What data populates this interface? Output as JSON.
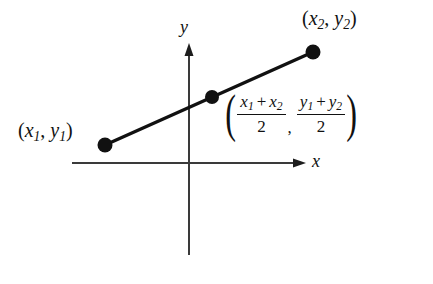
{
  "figure": {
    "background_color": "#ffffff",
    "ink_color": "#111111",
    "axis_color": "#3a3a3a"
  },
  "axes": {
    "x_label": "x",
    "y_label": "y",
    "origin": {
      "x": 189,
      "y": 163
    },
    "x_axis": {
      "start_x": 72,
      "end_x": 305,
      "y": 163
    },
    "y_axis": {
      "x": 189,
      "top_y": 45,
      "bottom_y": 255
    }
  },
  "segment": {
    "stroke_width": 3,
    "color": "#111111",
    "endpoints": [
      {
        "name": "point-1",
        "x": 105,
        "y": 145
      },
      {
        "name": "point-2",
        "x": 313,
        "y": 52
      }
    ],
    "midpoint": {
      "name": "midpoint",
      "x": 212,
      "y": 97
    },
    "dot_radius": 7
  },
  "labels": {
    "point1": {
      "open": "(",
      "var_x": "x",
      "sub_x": "1",
      "comma": ", ",
      "var_y": "y",
      "sub_y": "1",
      "close": ")"
    },
    "point2": {
      "open": "(",
      "var_x": "x",
      "sub_x": "2",
      "comma": ", ",
      "var_y": "y",
      "sub_y": "2",
      "close": ")"
    },
    "midpoint_formula": {
      "open_delim": "(",
      "close_delim": ")",
      "separator": ",",
      "x_fraction": {
        "num_first_var": "x",
        "num_first_sub": "1",
        "operator": "+",
        "num_second_var": "x",
        "num_second_sub": "2",
        "denominator": "2"
      },
      "y_fraction": {
        "num_first_var": "y",
        "num_first_sub": "1",
        "operator": "+",
        "num_second_var": "y",
        "num_second_sub": "2",
        "denominator": "2"
      }
    }
  }
}
